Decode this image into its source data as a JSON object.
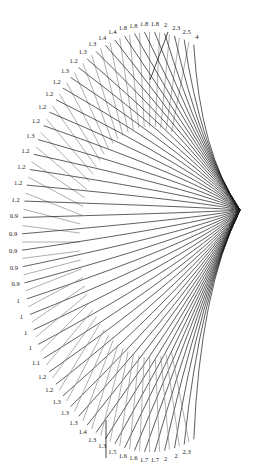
{
  "diagram": {
    "type": "radial-fan",
    "line_color": "#1a1a1a",
    "band_color": "#8c8c8c",
    "labels": [
      "4",
      "2.5",
      "2.3",
      "2",
      "1.8",
      "1.8",
      "1.8",
      "1.8",
      "1.4",
      "1.4",
      "1.3",
      "1.3",
      "1.2",
      "1.3",
      "1.2",
      "1.2",
      "1.2",
      "1.2",
      "1.3",
      "1.2",
      "1.2",
      "1.2",
      "1.2",
      "0.9",
      "0.9",
      "0.9",
      "0.9",
      "0.9",
      "1",
      "1",
      "1",
      "1",
      "1.1",
      "1.2",
      "1.2",
      "1.3",
      "1.3",
      "1.3",
      "1.4",
      "1.3",
      "1.3",
      "1.5",
      "1.6",
      "1.6",
      "1.7",
      "1.7",
      "2",
      "2",
      "2.3"
    ]
  }
}
